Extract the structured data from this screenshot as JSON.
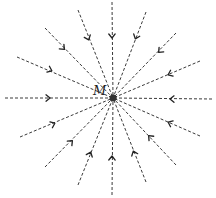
{
  "diagram": {
    "center": {
      "x": 113,
      "y": 98,
      "radius": 3.5
    },
    "charge_label": "M",
    "label_position": {
      "x": 93,
      "y": 95
    },
    "line_color": "#3a3a3a",
    "direction": "inward",
    "field_lines": [
      {
        "id": "top",
        "x1": 112,
        "y1": 2,
        "ax": 112,
        "ay": 36
      },
      {
        "id": "top-right-1",
        "x1": 146,
        "y1": 12,
        "ax": 136,
        "ay": 37
      },
      {
        "id": "top-right-2",
        "x1": 176,
        "y1": 33,
        "ax": 160,
        "ay": 51
      },
      {
        "id": "top-right-3",
        "x1": 200,
        "y1": 61,
        "ax": 170,
        "ay": 74
      },
      {
        "id": "right",
        "x1": 212,
        "y1": 99,
        "ax": 172,
        "ay": 99
      },
      {
        "id": "bottom-right-1",
        "x1": 200,
        "y1": 136,
        "ax": 170,
        "ay": 123
      },
      {
        "id": "bottom-right-2",
        "x1": 176,
        "y1": 165,
        "ax": 150,
        "ay": 137
      },
      {
        "id": "bottom-right-3",
        "x1": 146,
        "y1": 182,
        "ax": 134,
        "ay": 153
      },
      {
        "id": "bottom",
        "x1": 112,
        "y1": 195,
        "ax": 112,
        "ay": 158
      },
      {
        "id": "bottom-left-1",
        "x1": 78,
        "y1": 185,
        "ax": 90,
        "ay": 154
      },
      {
        "id": "bottom-left-2",
        "x1": 45,
        "y1": 167,
        "ax": 71,
        "ay": 142
      },
      {
        "id": "bottom-left-3",
        "x1": 20,
        "y1": 137,
        "ax": 53,
        "ay": 124
      },
      {
        "id": "left",
        "x1": 5,
        "y1": 98,
        "ax": 48,
        "ay": 98
      },
      {
        "id": "top-left-1",
        "x1": 17,
        "y1": 57,
        "ax": 50,
        "ay": 70
      },
      {
        "id": "top-left-2",
        "x1": 45,
        "y1": 28,
        "ax": 63,
        "ay": 48
      },
      {
        "id": "top-left-3",
        "x1": 78,
        "y1": 10,
        "ax": 88,
        "ay": 38
      }
    ]
  }
}
